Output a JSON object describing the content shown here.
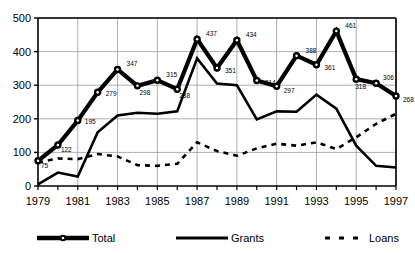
{
  "chart_data": {
    "type": "line",
    "title": "",
    "subtitle": "",
    "xlabel": "",
    "ylabel": "",
    "x": [
      1979,
      1980,
      1981,
      1982,
      1983,
      1984,
      1985,
      1986,
      1987,
      1988,
      1989,
      1990,
      1991,
      1992,
      1993,
      1994,
      1995,
      1996,
      1997
    ],
    "xlim": [
      1979,
      1997
    ],
    "ylim": [
      0,
      500
    ],
    "yticks": [
      0,
      100,
      200,
      300,
      400,
      500
    ],
    "ytick_labels": [
      "0",
      "100",
      "200",
      "300",
      "400",
      "500"
    ],
    "xticks": [
      1979,
      1981,
      1983,
      1985,
      1987,
      1989,
      1991,
      1993,
      1995,
      1997
    ],
    "xtick_labels": [
      "1979",
      "1981",
      "1983",
      "1985",
      "1987",
      "1989",
      "1991",
      "1993",
      "1995",
      "1997"
    ],
    "grid": true,
    "grid_axis": "both",
    "legend_position": "bottom",
    "series": [
      {
        "name": "Total",
        "style": "thick-line-with-circle-markers",
        "color": "#000000",
        "values": [
          75,
          122,
          195,
          279,
          347,
          298,
          315,
          288,
          437,
          351,
          434,
          314,
          297,
          388,
          361,
          461,
          318,
          306,
          268
        ],
        "point_labels": [
          "75",
          "122",
          "195",
          "279",
          "347",
          "298",
          "315",
          "288",
          "437",
          "351",
          "434",
          "314",
          "297",
          "388",
          "361",
          "461",
          "318",
          "306",
          "268"
        ]
      },
      {
        "name": "Grants",
        "style": "solid-line",
        "color": "#000000",
        "values": [
          5,
          40,
          28,
          160,
          210,
          218,
          215,
          222,
          380,
          305,
          300,
          198,
          222,
          221,
          272,
          230,
          120,
          60,
          55
        ]
      },
      {
        "name": "Loans",
        "style": "dashed-line",
        "color": "#000000",
        "values": [
          70,
          82,
          80,
          95,
          88,
          62,
          60,
          66,
          130,
          104,
          90,
          112,
          126,
          120,
          130,
          110,
          145,
          185,
          215
        ]
      }
    ]
  },
  "legend": {
    "items": [
      {
        "label": "Total",
        "marker": "line-with-circle"
      },
      {
        "label": "Grants",
        "marker": "solid-line"
      },
      {
        "label": "Loans",
        "marker": "dashed-line"
      }
    ]
  },
  "colors": {
    "foreground": "#000000",
    "grid": "#9a9a9a",
    "background": "#ffffff"
  }
}
